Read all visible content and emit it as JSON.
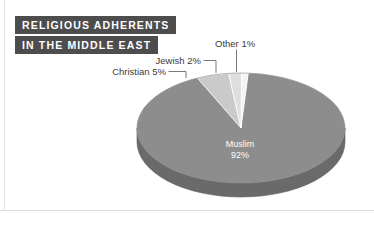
{
  "figure": {
    "width": 374,
    "height": 225,
    "background": "#ffffff"
  },
  "title": {
    "line1": "RELIGIOUS ADHERENTS",
    "line2": "IN THE MIDDLE EAST",
    "background_color": "#4d4d4d",
    "text_color": "#ffffff"
  },
  "callouts": {
    "christian": "Christian 5%",
    "jewish": "Jewish 2%",
    "other": "Other 1%"
  },
  "inner_label": {
    "name": "Muslim",
    "percent": "92%"
  },
  "chart_data": {
    "type": "pie",
    "title": "RELIGIOUS ADHERENTS IN THE MIDDLE EAST",
    "subtitle": "",
    "xlabel": "",
    "ylabel": "",
    "grid": false,
    "legend": "none",
    "three_d": true,
    "labels": [
      "Muslim",
      "Christian",
      "Jewish",
      "Other"
    ],
    "values": [
      92,
      5,
      2,
      1
    ],
    "value_labels": [
      "92%",
      "5%",
      "2%",
      "1%"
    ],
    "colors": [
      "#8d8d8d",
      "#cacaca",
      "#dedede",
      "#f4f4f4"
    ],
    "side_colors": [
      "#6a6a6a",
      "#9e9e9e",
      "#b0b0b0",
      "#c4c4c4"
    ],
    "annotations": [
      {
        "text": "Christian 5%",
        "leader": true
      },
      {
        "text": "Jewish 2%",
        "leader": true
      },
      {
        "text": "Other 1%",
        "leader": true
      },
      {
        "text": "Muslim 92%",
        "leader": false,
        "inside": true
      }
    ]
  }
}
